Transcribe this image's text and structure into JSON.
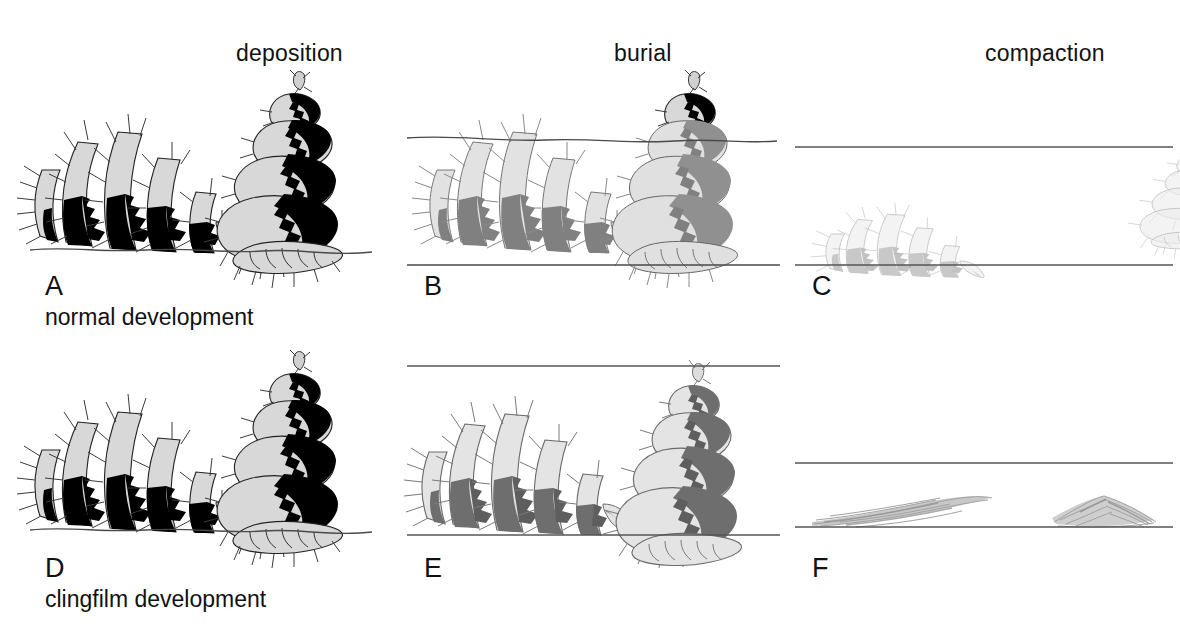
{
  "figure": {
    "type": "scientific-taphonomy-diagram",
    "grid": {
      "rows": 2,
      "columns": 3
    },
    "background_color": "#ffffff"
  },
  "column_headers": [
    {
      "id": "deposition",
      "label": "deposition",
      "x": 236,
      "y": 57
    },
    {
      "id": "burial",
      "label": "burial",
      "x": 614,
      "y": 57
    },
    {
      "id": "compaction",
      "label": "compaction",
      "x": 985,
      "y": 57
    }
  ],
  "row_captions": [
    {
      "id": "normal",
      "label": "normal development",
      "x": 45,
      "y": 322
    },
    {
      "id": "clingfilm",
      "label": "clingfilm development",
      "x": 45,
      "y": 604
    }
  ],
  "panels": [
    {
      "id": "A",
      "letter": "A",
      "row": "normal",
      "stage": "deposition",
      "letter_x": 45,
      "letter_y": 292,
      "ground": "irregular-wavy",
      "bounds_top": false,
      "bounds_bottom": false,
      "shading": "high-contrast-black",
      "objects": [
        "collapsed-helix",
        "upright-conical-helix"
      ]
    },
    {
      "id": "B",
      "letter": "B",
      "row": "normal",
      "stage": "burial",
      "letter_x": 424,
      "letter_y": 292,
      "ground": "irregular-wavy-sediment-surface",
      "bounds_top": false,
      "bounds_bottom": true,
      "shading": "mixed-grey-black",
      "objects": [
        "collapsed-helix",
        "upright-conical-helix"
      ]
    },
    {
      "id": "C",
      "letter": "C",
      "row": "normal",
      "stage": "compaction",
      "letter_x": 812,
      "letter_y": 292,
      "ground": "straight",
      "bounds_top": true,
      "bounds_bottom": true,
      "shading": "faded-grey",
      "objects": [
        "collapsed-helix-compressed",
        "upright-conical-helix-compressed"
      ]
    },
    {
      "id": "D",
      "letter": "D",
      "row": "clingfilm",
      "stage": "deposition",
      "letter_x": 45,
      "letter_y": 574,
      "ground": "irregular-wavy",
      "bounds_top": false,
      "bounds_bottom": false,
      "shading": "high-contrast-black",
      "objects": [
        "collapsed-helix",
        "upright-conical-helix"
      ]
    },
    {
      "id": "E",
      "letter": "E",
      "row": "clingfilm",
      "stage": "burial",
      "letter_x": 424,
      "letter_y": 574,
      "ground": "straight",
      "bounds_top": true,
      "bounds_bottom": true,
      "shading": "medium-grey",
      "objects": [
        "collapsed-helix",
        "upright-conical-helix"
      ]
    },
    {
      "id": "F",
      "letter": "F",
      "row": "clingfilm",
      "stage": "compaction",
      "letter_x": 812,
      "letter_y": 574,
      "ground": "straight",
      "bounds_top": true,
      "bounds_bottom": true,
      "shading": "smear-collapsed",
      "objects": [
        "flattened-smear-left",
        "flattened-smear-right"
      ]
    }
  ],
  "colors": {
    "ink": "#1a1a1a",
    "line": "#555555",
    "body_light": "#d8d8d8",
    "body_dark": "#000000",
    "faded_light": "#eaeaea",
    "faded_dark": "#9a9a9a",
    "mid_light": "#dcdcdc",
    "mid_dark": "#787878",
    "smear": "#9c9c9c"
  },
  "geometry": {
    "panel_A": {
      "x": 0,
      "y": 70,
      "w": 395,
      "h": 200
    },
    "panel_B": {
      "x": 395,
      "y": 70,
      "w": 395,
      "h": 200
    },
    "panel_C": {
      "x": 790,
      "y": 70,
      "w": 390,
      "h": 200
    },
    "panel_D": {
      "x": 0,
      "y": 350,
      "w": 395,
      "h": 200
    },
    "panel_E": {
      "x": 395,
      "y": 350,
      "w": 395,
      "h": 200
    },
    "panel_F": {
      "x": 790,
      "y": 350,
      "w": 390,
      "h": 200
    },
    "line_C_top_y": 147,
    "line_C_bottom_y": 265,
    "line_B_bottom_y": 265,
    "line_E_top_y": 364,
    "line_E_bottom_y": 533,
    "line_F_top_y": 463,
    "line_F_bottom_y": 527
  }
}
